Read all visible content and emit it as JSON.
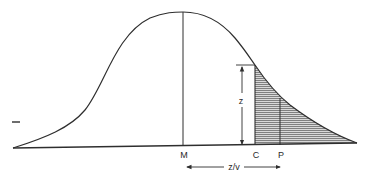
{
  "diagram": {
    "type": "normal-distribution-tail",
    "labels": {
      "mean": "M",
      "cutoff": "C",
      "point": "P",
      "height": "z",
      "distance": "z/v",
      "side_mark": "I"
    },
    "colors": {
      "stroke": "#2e2e2e",
      "hatch": "#555555",
      "shade": "#d6d6d6",
      "background": "#ffffff"
    }
  }
}
